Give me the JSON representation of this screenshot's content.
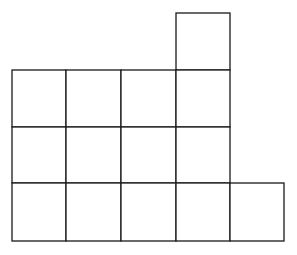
{
  "diagram": {
    "type": "unit-square-grid-figure",
    "stroke_color": "#1a1a1a",
    "fill_color": "#ffffff",
    "background": "#ffffff",
    "grid": {
      "column_edges_x": [
        12,
        66,
        121,
        176,
        230,
        284
      ],
      "row_edges_y": [
        13,
        70,
        127,
        183,
        241
      ]
    },
    "rows": [
      {
        "row": 0,
        "filled_columns": [
          3
        ]
      },
      {
        "row": 1,
        "filled_columns": [
          0,
          1,
          2,
          3
        ]
      },
      {
        "row": 2,
        "filled_columns": [
          0,
          1,
          2,
          3
        ]
      },
      {
        "row": 3,
        "filled_columns": [
          0,
          1,
          2,
          3,
          4
        ]
      }
    ],
    "square_count": 14
  }
}
